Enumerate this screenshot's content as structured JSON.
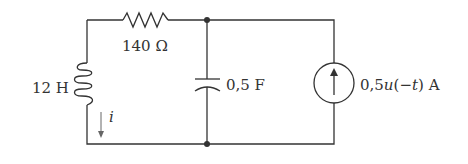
{
  "diagram": {
    "type": "circuit",
    "components": {
      "resistor": {
        "label": "140 Ω"
      },
      "inductor": {
        "label": "12 H"
      },
      "capacitor": {
        "label": "0,5 F"
      },
      "current_source": {
        "label_prefix": "0,5",
        "label_func": "u",
        "label_arg_open": "(",
        "label_arg": "−t",
        "label_arg_close": ")",
        "label_unit": " A"
      },
      "current_arrow": {
        "label": "i"
      }
    },
    "colors": {
      "wire": "#333333",
      "background": "#ffffff"
    }
  }
}
